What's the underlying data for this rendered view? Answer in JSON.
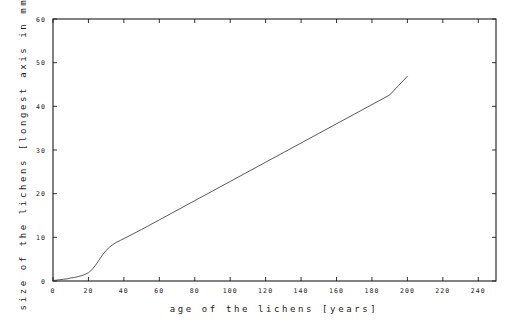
{
  "chart_data": {
    "type": "line",
    "title": "",
    "xlabel": "age of the lichens [years]",
    "ylabel": "size of the lichens [longest axis in mm]",
    "xlim": [
      0,
      250
    ],
    "ylim": [
      0,
      60
    ],
    "grid": false,
    "legend": null,
    "xticks": [
      0,
      20,
      40,
      60,
      80,
      100,
      120,
      140,
      160,
      180,
      200,
      220,
      240
    ],
    "xticklabels": [
      "0",
      "20",
      "40",
      "60",
      "80",
      "100",
      "120",
      "140",
      "160",
      "180",
      "200",
      "220",
      "240"
    ],
    "yticks": [
      0,
      10,
      20,
      30,
      40,
      50,
      60
    ],
    "yticklabels": [
      "0",
      "10",
      "20",
      "30",
      "40",
      "50",
      "60"
    ],
    "series": [
      {
        "name": "lichen growth",
        "color": "#3a3a42",
        "x": [
          0,
          2,
          4,
          6,
          8,
          10,
          12,
          14,
          16,
          18,
          20,
          22,
          24,
          26,
          28,
          30,
          32,
          34,
          36,
          38,
          40,
          50,
          60,
          70,
          80,
          90,
          100,
          110,
          120,
          130,
          140,
          150,
          160,
          170,
          180,
          190,
          200
        ],
        "y": [
          0.1,
          0.2,
          0.3,
          0.4,
          0.5,
          0.7,
          0.8,
          1.0,
          1.2,
          1.5,
          1.9,
          2.6,
          3.6,
          4.8,
          6.0,
          7.0,
          7.8,
          8.4,
          8.9,
          9.3,
          9.7,
          11.8,
          14.0,
          16.2,
          18.4,
          20.6,
          22.8,
          25.0,
          27.2,
          29.4,
          31.6,
          33.8,
          36.0,
          38.2,
          40.4,
          42.6,
          46.9
        ]
      }
    ]
  },
  "axis_titles": {
    "x": "age of the lichens [years]",
    "y": "size of the lichens [longest axis in mm]"
  }
}
